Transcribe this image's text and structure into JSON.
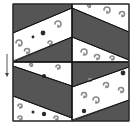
{
  "figure": {
    "type": "quilt-block-diagram",
    "background": "#ffffff",
    "colors": {
      "dark_fabric": "#555555",
      "light_fabric": "#ffffff",
      "print_motif": "#8a8a8a",
      "print_dot": "#2a2a2a",
      "seam_line": "#111111",
      "frame": "#333333"
    },
    "frame": {
      "x": 13,
      "y": 4,
      "width": 116,
      "height": 117
    },
    "arrow": {
      "direction": "down",
      "x": 7,
      "y1": 54,
      "y2": 76
    },
    "quadrants": [
      {
        "name": "top-left",
        "dark": [
          "13,4 72,4 72,8 13,33",
          "13,62 72,37 72,62"
        ],
        "light": [
          "13,33 72,8 72,37 13,61"
        ]
      },
      {
        "name": "top-right",
        "dark": [
          "72,8 129,32 129,60 72,37"
        ],
        "light": [
          "72,4 129,4 129,32 72,8",
          "72,37 129,60 129,62 72,62"
        ]
      },
      {
        "name": "bottom-left",
        "dark": [
          "13,66 72,86 72,118 13,96"
        ],
        "light": [
          "13,62 72,62 72,86 13,66",
          "13,96 72,118 72,121 13,121"
        ]
      },
      {
        "name": "bottom-right",
        "dark": [
          "72,62 129,62 129,67 72,87",
          "72,121 129,100 129,121"
        ],
        "light": [
          "72,87 129,67 129,100 72,120"
        ]
      }
    ],
    "motifs": [
      {
        "x": 43,
        "y": 33,
        "r": 2.4,
        "kind": "dot"
      },
      {
        "x": 33,
        "y": 37,
        "r": 1.4,
        "kind": "dot"
      },
      {
        "x": 58,
        "y": 24,
        "r": 3,
        "kind": "swirl"
      },
      {
        "x": 19,
        "y": 43,
        "r": 3,
        "kind": "swirl"
      },
      {
        "x": 27,
        "y": 51,
        "r": 2.5,
        "kind": "swirl"
      },
      {
        "x": 50,
        "y": 43,
        "r": 2,
        "kind": "swirl"
      },
      {
        "x": 107,
        "y": 10,
        "r": 3,
        "kind": "swirl"
      },
      {
        "x": 122,
        "y": 14,
        "r": 2.5,
        "kind": "swirl"
      },
      {
        "x": 89,
        "y": 6,
        "r": 1.5,
        "kind": "swirl"
      },
      {
        "x": 84,
        "y": 52,
        "r": 3,
        "kind": "swirl"
      },
      {
        "x": 97,
        "y": 57,
        "r": 2.5,
        "kind": "swirl"
      },
      {
        "x": 112,
        "y": 58,
        "r": 2,
        "kind": "swirl"
      },
      {
        "x": 44,
        "y": 76,
        "r": 2,
        "kind": "dot"
      },
      {
        "x": 58,
        "y": 67,
        "r": 2,
        "kind": "swirl"
      },
      {
        "x": 31,
        "y": 65,
        "r": 1.5,
        "kind": "swirl"
      },
      {
        "x": 20,
        "y": 106,
        "r": 2,
        "kind": "swirl"
      },
      {
        "x": 33,
        "y": 112,
        "r": 1.5,
        "kind": "dot"
      },
      {
        "x": 44,
        "y": 114,
        "r": 2.2,
        "kind": "dot"
      },
      {
        "x": 56,
        "y": 118,
        "r": 2,
        "kind": "swirl"
      },
      {
        "x": 20,
        "y": 118,
        "r": 2,
        "kind": "swirl"
      },
      {
        "x": 123,
        "y": 73,
        "r": 2.4,
        "kind": "dot"
      },
      {
        "x": 84,
        "y": 95,
        "r": 2.5,
        "kind": "swirl"
      },
      {
        "x": 96,
        "y": 100,
        "r": 3,
        "kind": "swirl"
      },
      {
        "x": 106,
        "y": 85,
        "r": 2.5,
        "kind": "swirl"
      },
      {
        "x": 121,
        "y": 90,
        "r": 2.5,
        "kind": "swirl"
      },
      {
        "x": 84,
        "y": 111,
        "r": 2.2,
        "kind": "dot"
      },
      {
        "x": 90,
        "y": 80,
        "r": 1.5,
        "kind": "swirl"
      }
    ]
  }
}
